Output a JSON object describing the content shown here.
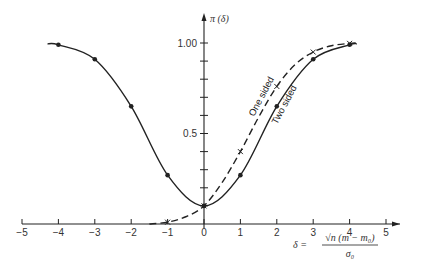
{
  "chart_data": {
    "type": "line",
    "title": "",
    "xlabel": "δ = √n (m − m₀) / σ₀",
    "xlabel_parts": {
      "lhs": "δ =",
      "numerator": "√n (m − m₀)",
      "denominator": "σ₀"
    },
    "ylabel": "π (δ)",
    "xlim": [
      -5,
      5
    ],
    "ylim": [
      0,
      1.0
    ],
    "x_ticks": [
      -5,
      -4,
      -3,
      -2,
      -1,
      0,
      1,
      2,
      3,
      4,
      5
    ],
    "x_tick_labels": [
      "−5",
      "−4",
      "−3",
      "−2",
      "−1",
      "0",
      "1",
      "2",
      "3",
      "4",
      "5"
    ],
    "y_ticks": [
      0.1,
      0.2,
      0.3,
      0.4,
      0.5,
      0.6,
      0.7,
      0.8,
      0.9,
      1.0
    ],
    "y_tick_labels": {
      "0.5": "0.5",
      "1.0": "1.00"
    },
    "grid": false,
    "legend": "inline curve labels",
    "series": [
      {
        "name": "Two sided",
        "style": "solid",
        "marker": "dot",
        "x": [
          -4.3,
          -4,
          -3,
          -2,
          -1,
          0,
          1,
          2,
          3,
          4,
          4.2
        ],
        "values": [
          0.995,
          0.99,
          0.91,
          0.65,
          0.27,
          0.1,
          0.27,
          0.65,
          0.91,
          0.99,
          0.995
        ],
        "marked_x": [
          -4,
          -3,
          -2,
          -1,
          0,
          1,
          2,
          3,
          4
        ]
      },
      {
        "name": "One sided",
        "style": "dashed",
        "marker": "cross",
        "x": [
          -1.5,
          -1,
          -0.5,
          0,
          0.5,
          1,
          1.5,
          2,
          2.5,
          3,
          3.5,
          4,
          4.2
        ],
        "values": [
          0.0,
          0.01,
          0.04,
          0.1,
          0.23,
          0.4,
          0.59,
          0.76,
          0.88,
          0.95,
          0.985,
          0.998,
          1.0
        ],
        "marked_x": [
          -1,
          0,
          1,
          2,
          3,
          4
        ]
      }
    ]
  }
}
